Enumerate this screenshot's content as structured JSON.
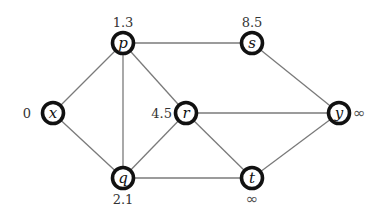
{
  "graph": {
    "nodes": [
      {
        "id": "x",
        "label": "x",
        "distance": "0",
        "cx": 53,
        "cy": 113,
        "dist_pos": "left"
      },
      {
        "id": "p",
        "label": "p",
        "distance": "1.3",
        "cx": 123,
        "cy": 43,
        "dist_pos": "top"
      },
      {
        "id": "q",
        "label": "q",
        "distance": "2.1",
        "cx": 123,
        "cy": 178,
        "dist_pos": "bottom"
      },
      {
        "id": "r",
        "label": "r",
        "distance": "4.5",
        "cx": 186,
        "cy": 113,
        "dist_pos": "left"
      },
      {
        "id": "s",
        "label": "s",
        "distance": "8.5",
        "cx": 252,
        "cy": 43,
        "dist_pos": "top"
      },
      {
        "id": "t",
        "label": "t",
        "distance": "∞",
        "cx": 252,
        "cy": 178,
        "dist_pos": "bottom"
      },
      {
        "id": "y",
        "label": "y",
        "distance": "∞",
        "cx": 339,
        "cy": 113,
        "dist_pos": "right"
      }
    ],
    "edges": [
      [
        "x",
        "p"
      ],
      [
        "x",
        "q"
      ],
      [
        "p",
        "q"
      ],
      [
        "p",
        "r"
      ],
      [
        "p",
        "s"
      ],
      [
        "q",
        "r"
      ],
      [
        "q",
        "t"
      ],
      [
        "r",
        "y"
      ],
      [
        "r",
        "t"
      ],
      [
        "s",
        "y"
      ],
      [
        "t",
        "y"
      ]
    ],
    "colors": {
      "edge": "#7a7a7a",
      "node_border": "#111111",
      "node_fill": "#ffffff"
    }
  }
}
